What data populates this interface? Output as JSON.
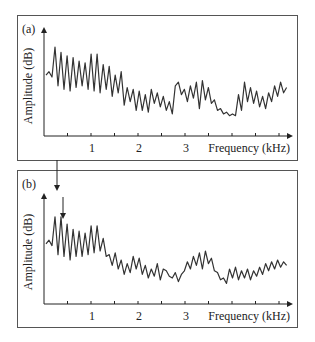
{
  "chart_data": [
    {
      "type": "line",
      "panel_label": "(a)",
      "title": "",
      "xlabel": "Frequency (kHz)",
      "ylabel": "Amplitude (dB)",
      "xticks": [
        "1",
        "2",
        "3"
      ],
      "xlim": [
        0,
        4
      ],
      "grid": false,
      "description": "Spectrum with strong periodic ripple below ~1.2 kHz decaying with frequency, noisy lower-level content 1.2-4 kHz, dip near 3.2 kHz, broad hump near 3.8 kHz",
      "x": [
        0.0,
        0.05,
        0.1,
        0.15,
        0.2,
        0.25,
        0.3,
        0.35,
        0.4,
        0.45,
        0.5,
        0.55,
        0.6,
        0.65,
        0.7,
        0.75,
        0.8,
        0.85,
        0.9,
        0.95,
        1.0,
        1.05,
        1.1,
        1.15,
        1.2,
        1.25,
        1.3,
        1.35,
        1.4,
        1.45,
        1.5,
        1.55,
        1.6,
        1.65,
        1.7,
        1.75,
        1.8,
        1.85,
        1.9,
        1.95,
        2.0,
        2.05,
        2.1,
        2.15,
        2.2,
        2.25,
        2.3,
        2.35,
        2.4,
        2.45,
        2.5,
        2.55,
        2.6,
        2.65,
        2.7,
        2.75,
        2.8,
        2.85,
        2.9,
        2.95,
        3.0,
        3.05,
        3.1,
        3.15,
        3.2,
        3.25,
        3.3,
        3.35,
        3.4,
        3.45,
        3.5,
        3.55,
        3.6,
        3.65,
        3.7,
        3.75,
        3.8,
        3.85,
        3.9,
        3.95,
        4.0
      ],
      "values": [
        60,
        64,
        58,
        92,
        48,
        86,
        44,
        82,
        42,
        80,
        46,
        76,
        48,
        74,
        44,
        84,
        42,
        84,
        40,
        72,
        44,
        70,
        36,
        60,
        40,
        64,
        26,
        46,
        30,
        44,
        20,
        42,
        20,
        38,
        18,
        44,
        28,
        40,
        24,
        36,
        20,
        30,
        16,
        48,
        52,
        38,
        44,
        30,
        48,
        34,
        52,
        22,
        54,
        32,
        46,
        28,
        32,
        20,
        22,
        16,
        18,
        14,
        16,
        14,
        38,
        20,
        52,
        30,
        46,
        28,
        42,
        24,
        36,
        22,
        40,
        30,
        48,
        36,
        52,
        40,
        46
      ]
    },
    {
      "type": "line",
      "panel_label": "(b)",
      "title": "",
      "xlabel": "Frequency (kHz)",
      "ylabel": "Amplitude (dB)",
      "xticks": [
        "1",
        "2",
        "3"
      ],
      "xlim": [
        0,
        4
      ],
      "grid": false,
      "annotations": [
        {
          "type": "arrow",
          "x": 0.3,
          "direction": "down",
          "note": "long arrow entering from above the panel"
        },
        {
          "type": "arrow",
          "x": 0.4,
          "direction": "down",
          "note": "short arrow"
        }
      ],
      "description": "Similar spectrum with strong ripple below ~1 kHz, lower noisy region 1-2.3 kHz, bump peaking near 2.7 kHz, dip near 3 kHz, gradual rise toward 4 kHz",
      "x": [
        0.0,
        0.05,
        0.1,
        0.15,
        0.2,
        0.25,
        0.3,
        0.35,
        0.4,
        0.45,
        0.5,
        0.55,
        0.6,
        0.65,
        0.7,
        0.75,
        0.8,
        0.85,
        0.9,
        0.95,
        1.0,
        1.05,
        1.1,
        1.15,
        1.2,
        1.25,
        1.3,
        1.35,
        1.4,
        1.45,
        1.5,
        1.55,
        1.6,
        1.65,
        1.7,
        1.75,
        1.8,
        1.85,
        1.9,
        1.95,
        2.0,
        2.05,
        2.1,
        2.15,
        2.2,
        2.25,
        2.3,
        2.35,
        2.4,
        2.45,
        2.5,
        2.55,
        2.6,
        2.65,
        2.7,
        2.75,
        2.8,
        2.85,
        2.9,
        2.95,
        3.0,
        3.05,
        3.1,
        3.15,
        3.2,
        3.25,
        3.3,
        3.35,
        3.4,
        3.45,
        3.5,
        3.55,
        3.6,
        3.65,
        3.7,
        3.75,
        3.8,
        3.85,
        3.9,
        3.95,
        4.0
      ],
      "values": [
        58,
        62,
        56,
        88,
        46,
        88,
        44,
        80,
        40,
        74,
        44,
        72,
        44,
        70,
        46,
        78,
        48,
        78,
        50,
        64,
        44,
        46,
        34,
        48,
        30,
        40,
        24,
        36,
        26,
        44,
        30,
        42,
        24,
        34,
        20,
        30,
        22,
        36,
        18,
        30,
        28,
        22,
        20,
        26,
        16,
        24,
        28,
        38,
        30,
        44,
        34,
        48,
        30,
        50,
        36,
        42,
        28,
        26,
        18,
        20,
        14,
        30,
        20,
        32,
        18,
        28,
        20,
        30,
        18,
        28,
        22,
        32,
        24,
        36,
        28,
        38,
        30,
        40,
        32,
        38,
        34
      ]
    }
  ]
}
